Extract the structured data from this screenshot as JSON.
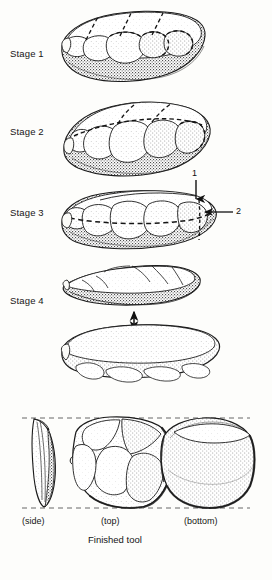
{
  "figure": {
    "background_color": "#fdfdfb",
    "ink_color": "#1b1b1b",
    "caption": "Finished tool"
  },
  "stages": [
    {
      "id": "stage-1",
      "label": "Stage 1",
      "description": "Nodule with initial flake scars removed around the perimeter; dashed lines mark planned removals on the upper surface."
    },
    {
      "id": "stage-2",
      "label": "Stage 2",
      "description": "Core trimmed further; more flakes struck from the margin producing a domed tortoise-shell upper face."
    },
    {
      "id": "stage-3",
      "label": "Stage 3",
      "description": "Striking platform prepared at one end; dashed line marks the intended plane of fracture.",
      "callouts": [
        {
          "number": "1",
          "arrow": "down",
          "meaning": "blow struck on prepared striking platform"
        },
        {
          "number": "2",
          "arrow": "left",
          "meaning": "prepared striking platform"
        }
      ]
    },
    {
      "id": "stage-4",
      "label": "Stage 4",
      "description": "The Levallois flake is detached from the prepared core; double-headed arrow indicates separation of flake from core."
    }
  ],
  "finished_tool": {
    "views": [
      {
        "id": "view-side",
        "label": "(side)"
      },
      {
        "id": "view-top",
        "label": "(top)"
      },
      {
        "id": "view-bottom",
        "label": "(bottom)"
      }
    ],
    "caption": "Finished tool",
    "guides": "horizontal dashed alignment lines at top and bottom of the three views"
  }
}
